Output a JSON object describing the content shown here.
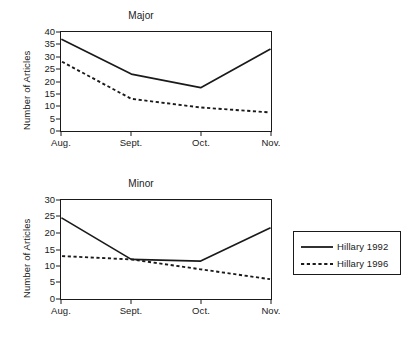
{
  "chart_data": [
    {
      "type": "line",
      "title": "Major",
      "xlabel": "",
      "ylabel": "Number of Articles",
      "x": [
        "Aug.",
        "Sept.",
        "Oct.",
        "Nov."
      ],
      "categories": [
        "Aug.",
        "Sept.",
        "Oct.",
        "Nov."
      ],
      "yticks": [
        0,
        5,
        10,
        15,
        20,
        25,
        30,
        35,
        40
      ],
      "ylim": [
        0,
        40
      ],
      "grid": false,
      "legend_position": "right-outside",
      "series": [
        {
          "name": "Hillary 1992",
          "style": "solid",
          "color": "#1a1a1a",
          "values": [
            37,
            23,
            17.5,
            33
          ]
        },
        {
          "name": "Hillary 1996",
          "style": "dotted",
          "color": "#1a1a1a",
          "values": [
            28,
            13,
            9.5,
            7.5
          ]
        }
      ]
    },
    {
      "type": "line",
      "title": "Minor",
      "xlabel": "",
      "ylabel": "Number of Articles",
      "x": [
        "Aug.",
        "Sept.",
        "Oct.",
        "Nov."
      ],
      "categories": [
        "Aug.",
        "Sept.",
        "Oct.",
        "Nov."
      ],
      "yticks": [
        0,
        5,
        10,
        15,
        20,
        25,
        30
      ],
      "ylim": [
        0,
        30
      ],
      "grid": false,
      "legend_position": "right-outside",
      "series": [
        {
          "name": "Hillary 1992",
          "style": "solid",
          "color": "#1a1a1a",
          "values": [
            24.5,
            12,
            11.5,
            21.5
          ]
        },
        {
          "name": "Hillary 1996",
          "style": "dotted",
          "color": "#1a1a1a",
          "values": [
            13,
            12,
            9,
            6
          ]
        }
      ]
    }
  ],
  "legend": {
    "entries": [
      {
        "label": "Hillary 1992",
        "style": "solid"
      },
      {
        "label": "Hillary 1996",
        "style": "dotted"
      }
    ]
  },
  "colors": {
    "ink": "#1a1a1a",
    "background": "#ffffff"
  }
}
